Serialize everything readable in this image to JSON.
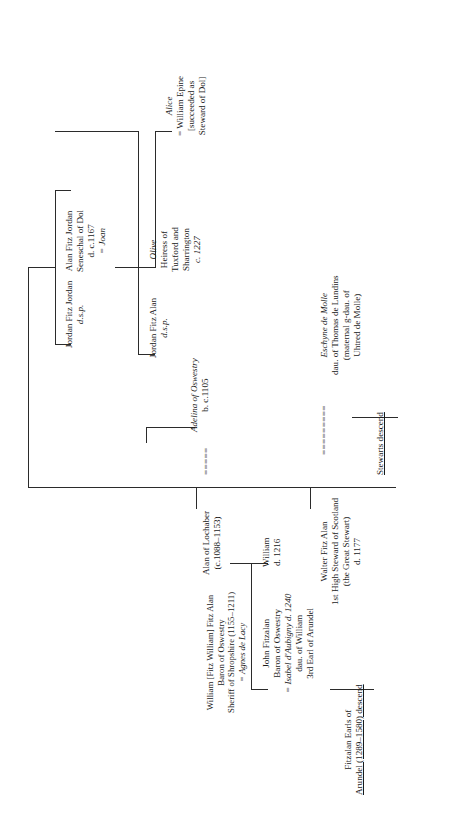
{
  "document": {
    "type": "genealogical-family-tree",
    "orientation": "rotated-90-counterclockwise",
    "title_visible": false
  },
  "persons": {
    "alan_of_lochaber": {
      "lines": [
        "Alan of Lochaber",
        "(c.1088–1153)"
      ],
      "name": "Alan of Lochaber",
      "dates": "(c.1088–1153)"
    },
    "adelina": {
      "lines": [
        "Adelina of Oswestry",
        "b. c.1105"
      ],
      "name": "Adelina of Oswestry",
      "dates": "b. c.1105"
    },
    "marriage_mark_1": "=====",
    "jordan_fitz_jordan": {
      "lines": [
        "Jordan Fitz Jordan",
        "d.s.p."
      ],
      "name": "Jordan Fitz Jordan",
      "note": "d.s.p."
    },
    "alan_fitz_jordan": {
      "lines": [
        "Alan Fitz Jordan",
        "Seneschal of Dol",
        "d. c.1167",
        "= Joan"
      ],
      "name": "Alan Fitz Jordan",
      "title": "Seneschal of Dol",
      "dates": "d. c.1167",
      "spouse": "= Joan"
    },
    "jordan_fitz_alan": {
      "lines": [
        "Jordan Fitz Alan",
        "d.s.p."
      ],
      "name": "Jordan Fitz Alan",
      "note": "d.s.p."
    },
    "olive": {
      "lines": [
        "Olive",
        "Heiress of",
        "Tuxford and",
        "Sharrington",
        "c. 1227"
      ],
      "name": "Olive",
      "desc1": "Heiress of",
      "desc2": "Tuxford and",
      "desc3": "Sharrington",
      "dates": "c. 1227"
    },
    "alice": {
      "lines": [
        "Alice",
        "= William Epine",
        "[succeeded as",
        "Steward of Dol]"
      ],
      "name": "Alice",
      "spouse": "= William Epine",
      "note1": "[succeeded as",
      "note2": "Steward of Dol]"
    },
    "william_fitz_alan": {
      "lines": [
        "William [Fitz William] Fitz Alan",
        "Baron of Oswestry",
        "Sheriff of Shropshire (1155–1211)",
        "= Agnes de Lacy"
      ],
      "name": "William [Fitz William] Fitz Alan",
      "title1": "Baron of Oswestry",
      "title2": "Sheriff of Shropshire (1155–1211)",
      "spouse": "= Agnes de Lacy"
    },
    "walter_fitz_alan": {
      "lines": [
        "Walter Fitz Alan",
        "1st High Steward of Scotland",
        "(the Great Stewart)",
        "d. 1177"
      ],
      "name": "Walter Fitz Alan",
      "title1": "1st High Steward of Scotland",
      "title2": "(the Great Stewart)",
      "dates": "d. 1177"
    },
    "marriage_mark_2": "=========",
    "eschyne_de_molle": {
      "lines": [
        "Eschyne de Molle",
        "dau. of Thomas de Lundins",
        "(maternal g-dau. of",
        "Uhtred de Molle)"
      ],
      "name": "Eschyne de Molle",
      "desc1": "dau. of Thomas de Lundins",
      "desc2": "(maternal g-dau. of",
      "desc3": "Uhtred de Molle)"
    },
    "john_fitzalan": {
      "lines": [
        "John Fitzalan",
        "Baron of Oswestry",
        "= Isabel d'Aubigny d. 1240",
        "dau. of William",
        "3rd Earl of Arundel"
      ],
      "name": "John Fitzalan",
      "title": "Baron of Oswestry",
      "spouse": "= Isabel d'Aubigny d. 1240",
      "desc1": "dau. of William",
      "desc2": "3rd Earl of Arundel"
    },
    "william_d1216": {
      "lines": [
        "William",
        "d. 1216"
      ],
      "name": "William",
      "dates": "d. 1216"
    }
  },
  "descent_notes": {
    "stewarts": "Stewarts descend",
    "fitzalan_line1": "Fitzalan Earls of",
    "fitzalan_line2": "Arundel (1289–1580) descend"
  },
  "colors": {
    "background": "#ffffff",
    "text": "#1a1a1a",
    "lines": "#2b2b2b"
  }
}
